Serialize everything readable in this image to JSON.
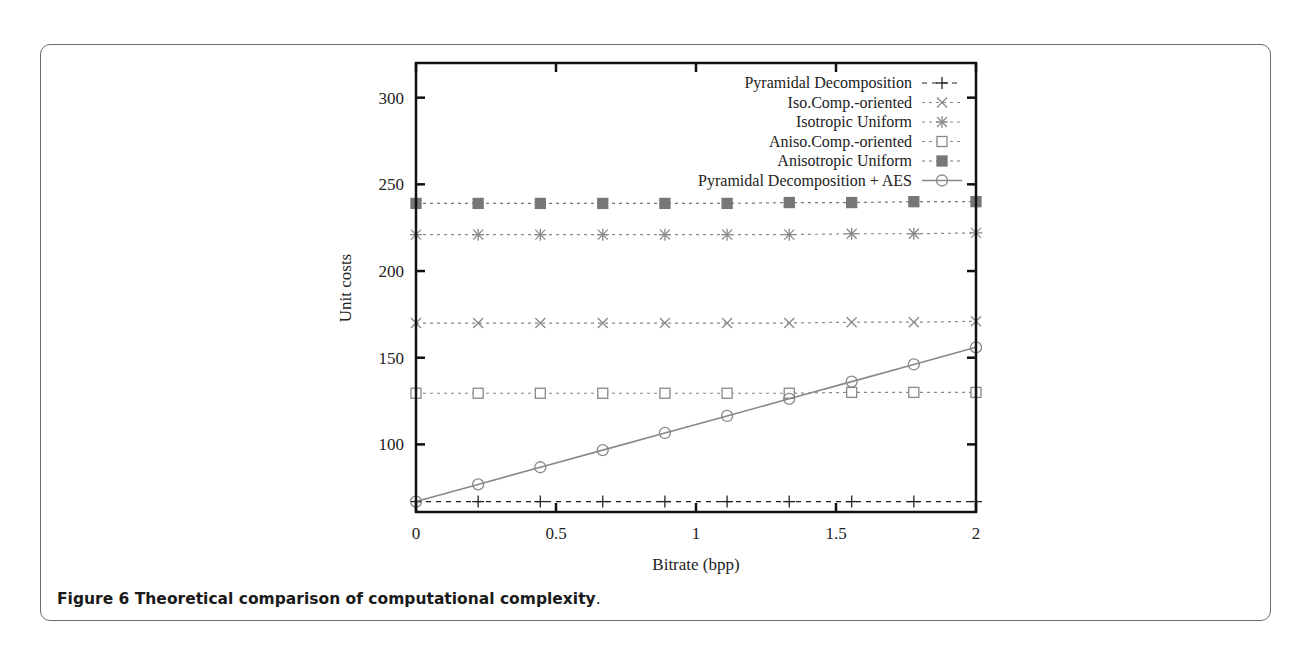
{
  "figure": {
    "caption_bold": "Figure 6 Theoretical comparison of computational complexity",
    "caption_tail": "."
  },
  "chart_data": {
    "type": "line",
    "title": "",
    "xlabel": "Bitrate (bpp)",
    "ylabel": "Unit costs",
    "xlim": [
      0,
      2
    ],
    "ylim": [
      61,
      320
    ],
    "xticks": [
      "0",
      "0.5",
      "1",
      "1.5",
      "2"
    ],
    "yticks": [
      "100",
      "150",
      "200",
      "250",
      "300"
    ],
    "grid": false,
    "legend_position": "top-right",
    "x": [
      0,
      0.222,
      0.444,
      0.667,
      0.889,
      1.111,
      1.333,
      1.556,
      1.778,
      2.0
    ],
    "series": [
      {
        "name": "Pyramidal Decomposition",
        "marker": "plus",
        "line": "dashed",
        "color": "#222222",
        "values": [
          67,
          67,
          67,
          67,
          67,
          67,
          67,
          67,
          67,
          67
        ]
      },
      {
        "name": "Iso.Comp.-oriented",
        "marker": "x",
        "line": "dotted",
        "color": "#888888",
        "values": [
          170,
          170,
          170,
          170,
          170,
          170,
          170,
          170.5,
          170.5,
          171
        ]
      },
      {
        "name": "Isotropic Uniform",
        "marker": "star",
        "line": "dotted",
        "color": "#888888",
        "values": [
          221,
          221,
          221,
          221,
          221,
          221,
          221,
          221.5,
          221.5,
          222
        ]
      },
      {
        "name": "Aniso.Comp.-oriented",
        "marker": "open-square",
        "line": "dotted",
        "color": "#888888",
        "values": [
          129.5,
          129.5,
          129.5,
          129.5,
          129.5,
          129.5,
          129.5,
          130,
          130,
          130
        ]
      },
      {
        "name": "Anisotropic Uniform",
        "marker": "filled-square",
        "line": "dotted",
        "color": "#777777",
        "values": [
          239,
          239,
          239,
          239,
          239,
          239,
          239.5,
          239.5,
          240,
          240
        ]
      },
      {
        "name": "Pyramidal Decomposition + AES",
        "marker": "open-circle",
        "line": "solid",
        "color": "#888888",
        "values": [
          67,
          76.9,
          86.8,
          96.7,
          106.6,
          116.4,
          126.3,
          136.2,
          146.1,
          156
        ]
      }
    ]
  }
}
